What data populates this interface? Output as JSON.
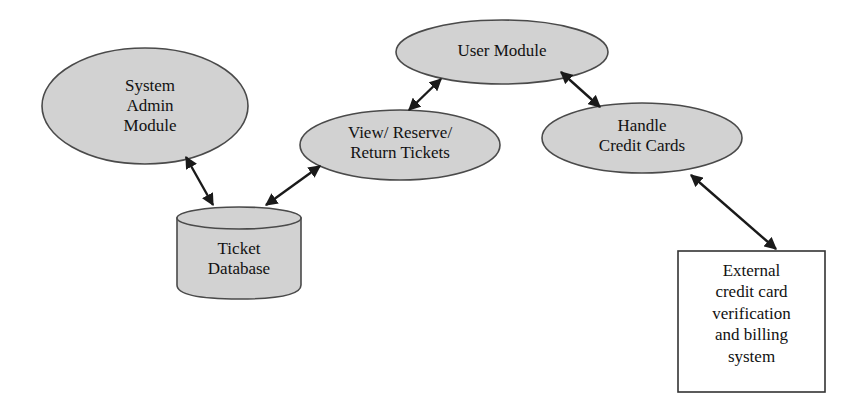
{
  "diagram": {
    "background_color": "#ffffff",
    "shape_fill": "#d2d2d2",
    "shape_stroke": "#4a4a4a",
    "box_fill": "#ffffff",
    "box_stroke": "#333333",
    "arrow_color": "#1a1a1a",
    "nodes": {
      "system_admin": {
        "label": "System\nAdmin\nModule",
        "shape": "ellipse"
      },
      "user_module": {
        "label": "User Module",
        "shape": "ellipse"
      },
      "view_reserve": {
        "label": "View/ Reserve/\nReturn Tickets",
        "shape": "ellipse"
      },
      "handle_credit": {
        "label": "Handle\nCredit Cards",
        "shape": "ellipse"
      },
      "ticket_database": {
        "label": "Ticket\nDatabase",
        "shape": "cylinder"
      },
      "external_system": {
        "label": "External\ncredit card\nverification\nand billing\nsystem",
        "shape": "rectangle"
      }
    },
    "connectors": [
      {
        "id": "admin-to-db",
        "from": "system_admin",
        "to": "ticket_database",
        "style": "double-arrow"
      },
      {
        "id": "db-to-view",
        "from": "ticket_database",
        "to": "view_reserve",
        "style": "double-arrow"
      },
      {
        "id": "view-to-user",
        "from": "view_reserve",
        "to": "user_module",
        "style": "double-arrow"
      },
      {
        "id": "user-to-credit",
        "from": "user_module",
        "to": "handle_credit",
        "style": "double-arrow"
      },
      {
        "id": "credit-to-external",
        "from": "handle_credit",
        "to": "external_system",
        "style": "double-arrow"
      }
    ]
  }
}
